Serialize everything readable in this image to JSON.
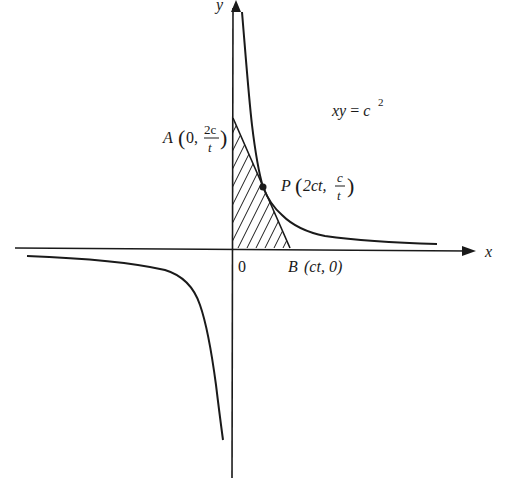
{
  "figure": {
    "equation": {
      "lhs": "xy",
      "eq": " = ",
      "base": "c",
      "exp": "2"
    },
    "axes": {
      "x_label": "x",
      "y_label": "y",
      "origin_label": "0"
    },
    "points": {
      "A": {
        "name": "A",
        "open": "(",
        "first": "0,",
        "num": "2c",
        "den": "t",
        "close": ")"
      },
      "P": {
        "name": "P",
        "open": "(",
        "first": "2ct,",
        "num": "c",
        "den": "t",
        "close": ")"
      },
      "B": {
        "name": "B",
        "coords": "(ct, 0)"
      }
    },
    "shaded_region": "triangle OAB",
    "colors": {
      "ink": "#1a1a1a",
      "background": "#ffffff"
    }
  }
}
